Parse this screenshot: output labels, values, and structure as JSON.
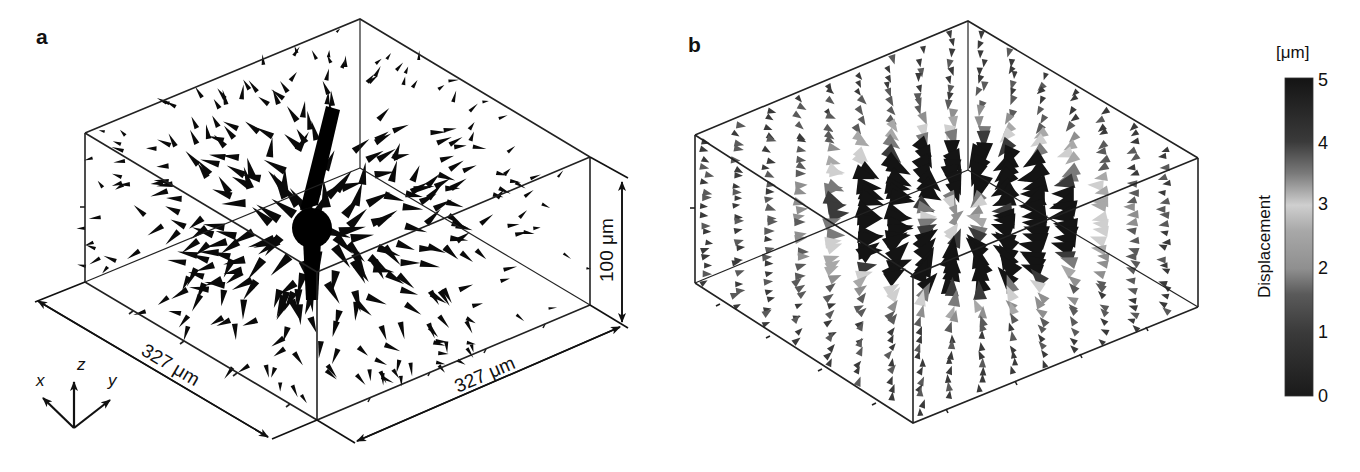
{
  "chart_data": [
    {
      "type": "scatter",
      "subtype": "3d-quiver",
      "panel": "a",
      "title": "",
      "description": "3D displacement vector field (cone glyphs) around a central bead; monochrome black glyphs",
      "box_dimensions": {
        "x": "327 μm",
        "y": "327 μm",
        "z": "100 μm"
      },
      "axis_labels": {
        "x": "x",
        "y": "y",
        "z": "z"
      },
      "grid": false,
      "legend": null
    },
    {
      "type": "scatter",
      "subtype": "3d-quiver",
      "panel": "b",
      "title": "",
      "description": "3D displacement vector field (cone glyphs) shaded by displacement magnitude",
      "colorbar": {
        "label": "Displacement",
        "unit": "[μm]",
        "ticks": [
          0,
          1,
          2,
          3,
          4,
          5
        ],
        "range": [
          0,
          5
        ],
        "colormap_stops": [
          {
            "value": 0,
            "color": "#1a1a1a"
          },
          {
            "value": 1,
            "color": "#3a3a3a"
          },
          {
            "value": 1.6,
            "color": "#5a5a5a"
          },
          {
            "value": 2,
            "color": "#8f8f8f"
          },
          {
            "value": 2.6,
            "color": "#a8a8a8"
          },
          {
            "value": 3,
            "color": "#cfcfcf"
          },
          {
            "value": 3.5,
            "color": "#7a7a7a"
          },
          {
            "value": 4,
            "color": "#3a3a3a"
          },
          {
            "value": 5,
            "color": "#141414"
          }
        ]
      },
      "grid": false
    }
  ],
  "figure": {
    "panel_a_label": "a",
    "panel_b_label": "b",
    "dim_x": "327 μm",
    "dim_y": "327 μm",
    "dim_z": "100 μm",
    "axis_x": "x",
    "axis_y": "y",
    "axis_z": "z",
    "colorbar_title": "Displacement",
    "colorbar_unit": "[μm]",
    "colorbar_ticks": [
      "5",
      "4",
      "3",
      "2",
      "1",
      "0"
    ]
  }
}
